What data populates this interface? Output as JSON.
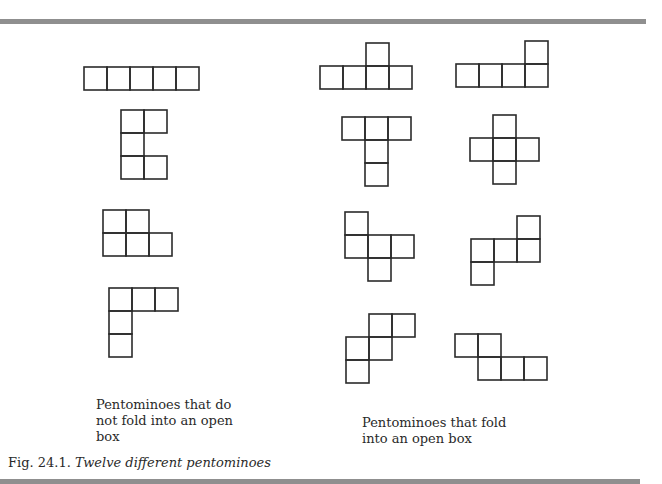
{
  "figure": {
    "number": "Fig. 24.1.",
    "title": "Twelve different pentominoes",
    "cell_size": 23,
    "stroke_color": "#2b2b2b",
    "groups": [
      {
        "label_lines": [
          "Pentominoes that do",
          "not fold into an open",
          "box"
        ],
        "pentominoes": [
          {
            "name": "I",
            "origin": [
              84,
              67
            ],
            "cells": [
              [
                0,
                0
              ],
              [
                1,
                0
              ],
              [
                2,
                0
              ],
              [
                3,
                0
              ],
              [
                4,
                0
              ]
            ]
          },
          {
            "name": "U",
            "origin": [
              121,
              110
            ],
            "cells": [
              [
                0,
                0
              ],
              [
                1,
                0
              ],
              [
                0,
                1
              ],
              [
                0,
                2
              ],
              [
                1,
                2
              ]
            ]
          },
          {
            "name": "P",
            "origin": [
              103,
              210
            ],
            "cells": [
              [
                0,
                0
              ],
              [
                1,
                0
              ],
              [
                0,
                1
              ],
              [
                1,
                1
              ],
              [
                2,
                1
              ]
            ]
          },
          {
            "name": "V",
            "origin": [
              109,
              288
            ],
            "cells": [
              [
                0,
                0
              ],
              [
                1,
                0
              ],
              [
                2,
                0
              ],
              [
                0,
                1
              ],
              [
                0,
                2
              ]
            ]
          }
        ]
      },
      {
        "label_lines": [
          "Pentominoes that fold",
          "into an open box"
        ],
        "pentominoes": [
          {
            "name": "Y",
            "origin": [
              320,
              43
            ],
            "cells": [
              [
                2,
                0
              ],
              [
                0,
                1
              ],
              [
                1,
                1
              ],
              [
                2,
                1
              ],
              [
                3,
                1
              ]
            ]
          },
          {
            "name": "L",
            "origin": [
              456,
              41
            ],
            "cells": [
              [
                3,
                0
              ],
              [
                0,
                1
              ],
              [
                1,
                1
              ],
              [
                2,
                1
              ],
              [
                3,
                1
              ]
            ]
          },
          {
            "name": "T",
            "origin": [
              342,
              117
            ],
            "cells": [
              [
                0,
                0
              ],
              [
                1,
                0
              ],
              [
                2,
                0
              ],
              [
                1,
                1
              ],
              [
                1,
                2
              ]
            ]
          },
          {
            "name": "X",
            "origin": [
              470,
              115
            ],
            "cells": [
              [
                1,
                0
              ],
              [
                0,
                1
              ],
              [
                1,
                1
              ],
              [
                2,
                1
              ],
              [
                1,
                2
              ]
            ]
          },
          {
            "name": "F",
            "origin": [
              345,
              212
            ],
            "cells": [
              [
                0,
                0
              ],
              [
                0,
                1
              ],
              [
                1,
                1
              ],
              [
                2,
                1
              ],
              [
                1,
                2
              ]
            ]
          },
          {
            "name": "Z",
            "origin": [
              471,
              216
            ],
            "cells": [
              [
                2,
                0
              ],
              [
                0,
                1
              ],
              [
                1,
                1
              ],
              [
                2,
                1
              ],
              [
                0,
                2
              ]
            ]
          },
          {
            "name": "W",
            "origin": [
              346,
              314
            ],
            "cells": [
              [
                1,
                0
              ],
              [
                2,
                0
              ],
              [
                0,
                1
              ],
              [
                1,
                1
              ],
              [
                0,
                2
              ]
            ]
          },
          {
            "name": "N",
            "origin": [
              455,
              334
            ],
            "cells": [
              [
                0,
                0
              ],
              [
                1,
                0
              ],
              [
                1,
                1
              ],
              [
                2,
                1
              ],
              [
                3,
                1
              ]
            ]
          }
        ]
      }
    ]
  }
}
